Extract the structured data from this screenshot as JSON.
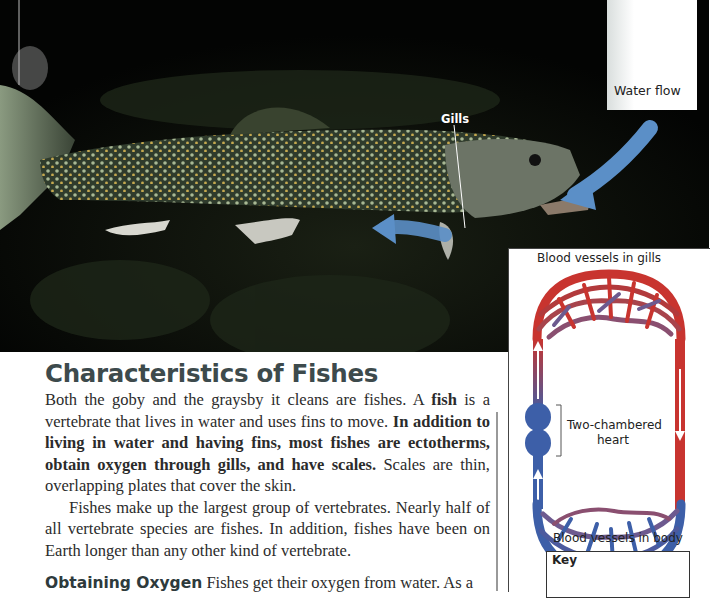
{
  "photo": {
    "description": "trout with gills and water flow arrows",
    "labels": {
      "water_flow": "Water flow",
      "gills": "Gills"
    },
    "colors": {
      "water_arrow": "#5b8fc7",
      "background": "#050605"
    }
  },
  "diagram": {
    "top_label": "Blood vessels in gills",
    "heart_label_line1": "Two-chambered",
    "heart_label_line2": "heart",
    "bottom_label": "Blood vessels in body",
    "key_title": "Key",
    "colors": {
      "oxygen_poor": "#3d5fa8",
      "oxygen_rich": "#c8342f",
      "heart": "#3d5fa8"
    }
  },
  "content": {
    "heading": "Characteristics of Fishes",
    "p1_a": "Both the goby and the graysby it cleans are fishes. A ",
    "p1_term": "fish",
    "p1_b": " is a vertebrate that lives in water and uses fins to move. ",
    "p1_bold": "In addition to living in water and having fins, most fishes are ectotherms, obtain oxygen through gills, and have scales.",
    "p1_c": " Scales are thin, overlapping plates that cover the skin.",
    "p2": "Fishes make up the largest group of vertebrates. Nearly half of all vertebrate species are fishes. In addition, fishes have been on Earth longer than any other kind of vertebrate.",
    "p3_heading": "Obtaining Oxygen",
    "p3_text": "  Fishes get their oxygen from water. As a"
  }
}
